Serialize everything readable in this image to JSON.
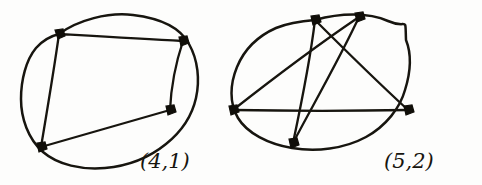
{
  "page": {
    "background_color": "#fdfdfc",
    "ink_color": "#17150f"
  },
  "figures": [
    {
      "id": "figure-left",
      "label": "(4,1)",
      "label_position": {
        "x": 140,
        "y": 168
      },
      "vertex_count": 4,
      "chord_count": 4,
      "crossing_count": 1,
      "outline": {
        "shape": "circle",
        "center": {
          "x": 106,
          "y": 88
        },
        "radius_x": 85,
        "radius_y": 78,
        "rotation_deg": -12
      },
      "vertices": [
        {
          "name": "v1",
          "x": 59,
          "y": 34
        },
        {
          "name": "v2",
          "x": 183,
          "y": 41
        },
        {
          "name": "v3",
          "x": 170,
          "y": 110
        },
        {
          "name": "v4",
          "x": 41,
          "y": 147
        }
      ],
      "chords": [
        {
          "from": "v1",
          "to": "v2"
        },
        {
          "from": "v2",
          "to": "v3"
        },
        {
          "from": "v3",
          "to": "v4"
        },
        {
          "from": "v4",
          "to": "v1"
        }
      ]
    },
    {
      "id": "figure-right",
      "label": "(5,2)",
      "label_position": {
        "x": 384,
        "y": 168
      },
      "vertex_count": 5,
      "chord_count": 5,
      "crossing_count": 2,
      "outline": {
        "shape": "ellipse",
        "center": {
          "x": 320,
          "y": 82
        },
        "radius_x": 88,
        "radius_y": 70,
        "rotation_deg": -8
      },
      "vertices": [
        {
          "name": "w1",
          "x": 315,
          "y": 20
        },
        {
          "name": "w2",
          "x": 359,
          "y": 17
        },
        {
          "name": "w3",
          "x": 408,
          "y": 110
        },
        {
          "name": "w4",
          "x": 293,
          "y": 143
        },
        {
          "name": "w5",
          "x": 233,
          "y": 110
        }
      ],
      "chords": [
        {
          "from": "w5",
          "to": "w2"
        },
        {
          "from": "w5",
          "to": "w3"
        },
        {
          "from": "w1",
          "to": "w4"
        },
        {
          "from": "w1",
          "to": "w3"
        },
        {
          "from": "w2",
          "to": "w4"
        }
      ]
    }
  ]
}
